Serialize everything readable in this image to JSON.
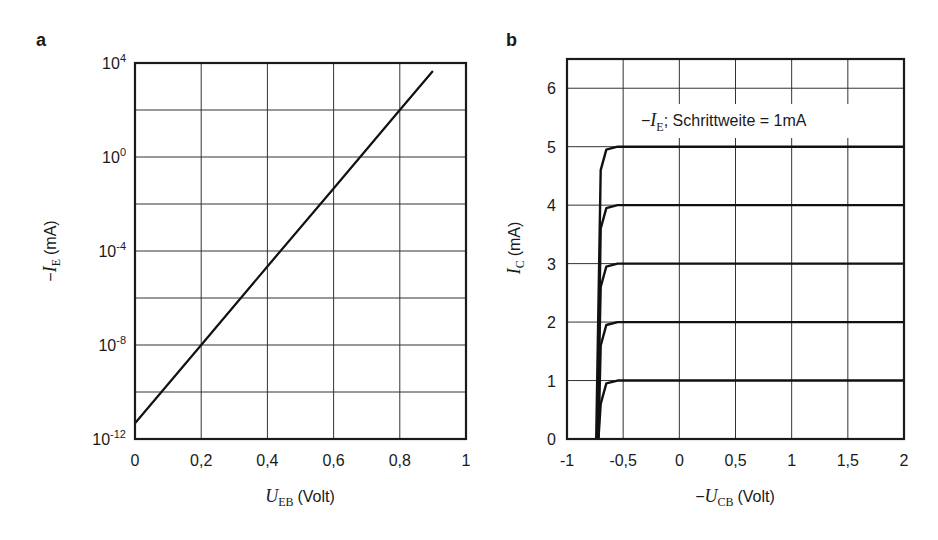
{
  "chart_data": [
    {
      "panel": "a",
      "type": "line",
      "title": "",
      "xlabel": "U_EB (Volt)",
      "xlabel_main": "U",
      "xlabel_sub": "EB",
      "xlabel_unit": "(Volt)",
      "ylabel": "-I_E (mA)",
      "ylabel_prefix": "−",
      "ylabel_main": "I",
      "ylabel_sub": "E",
      "ylabel_unit": "(mA)",
      "yscale": "log",
      "xlim": [
        0,
        1
      ],
      "ylim": [
        1e-12,
        10000.0
      ],
      "x_ticks": [
        "0",
        "0,2",
        "0,4",
        "0,6",
        "0,8",
        "1"
      ],
      "y_ticks": [
        {
          "base": "10",
          "exp": "4"
        },
        {
          "base": "10",
          "exp": "0"
        },
        {
          "base": "10",
          "exp": "-4"
        },
        {
          "base": "10",
          "exp": "-8"
        },
        {
          "base": "10",
          "exp": "-12"
        }
      ],
      "grid": true,
      "series": [
        {
          "name": "-I_E",
          "x": [
            0,
            0.2,
            0.4,
            0.6,
            0.8,
            0.9
          ],
          "y": [
            4.7e-12,
            1e-08,
            2.2e-05,
            0.046,
            100,
            4600
          ]
        }
      ]
    },
    {
      "panel": "b",
      "type": "line",
      "title": "",
      "annotation": {
        "prefix": "−",
        "main": "I",
        "sub": "E",
        "text": "; Schrittweite = 1mA"
      },
      "xlabel": "-U_CB (Volt)",
      "xlabel_prefix": "−",
      "xlabel_main": "U",
      "xlabel_sub": "CB",
      "xlabel_unit": "(Volt)",
      "ylabel": "I_C (mA)",
      "ylabel_main": "I",
      "ylabel_sub": "C",
      "ylabel_unit": "(mA)",
      "xlim": [
        -1,
        2
      ],
      "ylim": [
        0,
        6.5
      ],
      "x_ticks": [
        "-1",
        "-0,5",
        "0",
        "0,5",
        "1",
        "1,5",
        "2"
      ],
      "y_ticks": [
        "0",
        "1",
        "2",
        "3",
        "4",
        "5",
        "6"
      ],
      "grid": true,
      "series": [
        {
          "name": "-I_E = 1 mA",
          "x": [
            -0.72,
            -0.7,
            -0.65,
            -0.55,
            2
          ],
          "y": [
            0,
            0.6,
            0.95,
            1,
            1
          ]
        },
        {
          "name": "-I_E = 2 mA",
          "x": [
            -0.72,
            -0.7,
            -0.65,
            -0.55,
            2
          ],
          "y": [
            0,
            1.6,
            1.95,
            2,
            2
          ]
        },
        {
          "name": "-I_E = 3 mA",
          "x": [
            -0.73,
            -0.7,
            -0.65,
            -0.55,
            2
          ],
          "y": [
            0,
            2.6,
            2.95,
            3,
            3
          ]
        },
        {
          "name": "-I_E = 4 mA",
          "x": [
            -0.73,
            -0.7,
            -0.65,
            -0.55,
            2
          ],
          "y": [
            0,
            3.6,
            3.95,
            4,
            4
          ]
        },
        {
          "name": "-I_E = 5 mA",
          "x": [
            -0.74,
            -0.7,
            -0.65,
            -0.55,
            2
          ],
          "y": [
            0,
            4.6,
            4.95,
            5,
            5
          ]
        }
      ]
    }
  ]
}
